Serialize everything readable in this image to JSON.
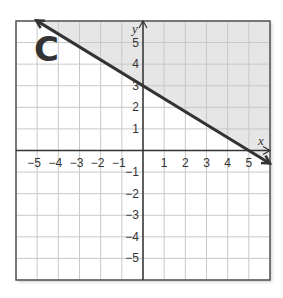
{
  "panel_label": "C",
  "chart_data": {
    "type": "line",
    "title": "",
    "panel_label": "C",
    "xlabel": "x",
    "ylabel": "y",
    "xlim": [
      -6,
      6
    ],
    "ylim": [
      -6,
      6
    ],
    "grid": true,
    "x_ticks": [
      -5,
      -4,
      -3,
      -2,
      -1,
      1,
      2,
      3,
      4,
      5
    ],
    "x_tick_labels": [
      "−5",
      "−4",
      "−3",
      "−2",
      "−1",
      "1",
      "2",
      "3",
      "4",
      "5"
    ],
    "y_ticks": [
      5,
      4,
      3,
      2,
      1,
      -1,
      -2,
      -3,
      -4,
      -5
    ],
    "y_tick_labels": [
      "5",
      "4",
      "3",
      "2",
      "1",
      "−1",
      "−2",
      "−3",
      "−4",
      "−5"
    ],
    "series": [
      {
        "name": "boundary line",
        "equation": "y = -3/5 x + 3",
        "style": "solid",
        "arrows": "both",
        "points": [
          {
            "x": -5,
            "y": 6
          },
          {
            "x": 0,
            "y": 3
          },
          {
            "x": 5,
            "y": 0
          },
          {
            "x": 6,
            "y": -0.6
          }
        ]
      }
    ],
    "shaded_region": "above line",
    "inequality": "y >= -3/5 x + 3",
    "colors": {
      "shade": "#e6e6e6",
      "grid": "#c8c8c8",
      "line": "#333333",
      "axis": "#333333"
    }
  }
}
